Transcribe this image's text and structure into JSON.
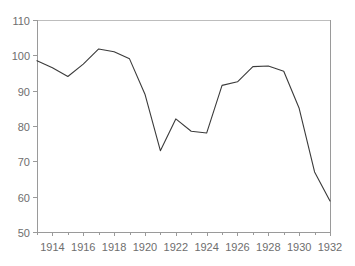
{
  "chart_data": {
    "type": "line",
    "title": "",
    "subtitle": "",
    "xlabel": "",
    "ylabel": "",
    "xlim": [
      1913,
      1932
    ],
    "ylim": [
      50,
      110
    ],
    "grid": false,
    "legend": null,
    "x_ticks": [
      1914,
      1916,
      1918,
      1920,
      1922,
      1924,
      1926,
      1928,
      1930,
      1932
    ],
    "x_tick_labels": [
      "1914",
      "1916",
      "1918",
      "1920",
      "1922",
      "1924",
      "1926",
      "1928",
      "1930",
      "1932"
    ],
    "y_ticks": [
      50,
      60,
      70,
      80,
      90,
      100,
      110
    ],
    "y_tick_labels": [
      "50",
      "60",
      "70",
      "80",
      "90",
      "100",
      "110"
    ],
    "x": [
      1913,
      1914,
      1915,
      1916,
      1917,
      1918,
      1919,
      1920,
      1921,
      1922,
      1923,
      1924,
      1925,
      1926,
      1927,
      1928,
      1929,
      1930,
      1931,
      1932
    ],
    "values": [
      98.5,
      96.5,
      94.0,
      97.5,
      101.8,
      101.0,
      99.0,
      89.0,
      73.0,
      82.0,
      78.5,
      78.0,
      91.5,
      92.5,
      96.8,
      97.0,
      95.5,
      85.0,
      67.0,
      58.8
    ],
    "series": [
      {
        "name": "series-1",
        "color": "#3b3b3b",
        "values": [
          98.5,
          96.5,
          94.0,
          97.5,
          101.8,
          101.0,
          99.0,
          89.0,
          73.0,
          82.0,
          78.5,
          78.0,
          91.5,
          92.5,
          96.8,
          97.0,
          95.5,
          85.0,
          67.0,
          58.8
        ]
      }
    ],
    "annotations": []
  },
  "colors": {
    "line": "#3b3b3b",
    "axis": "#9a9a9a",
    "top_rule": "#bdbdbd",
    "tick_label": "#6e6e6e",
    "background": "#ffffff"
  }
}
